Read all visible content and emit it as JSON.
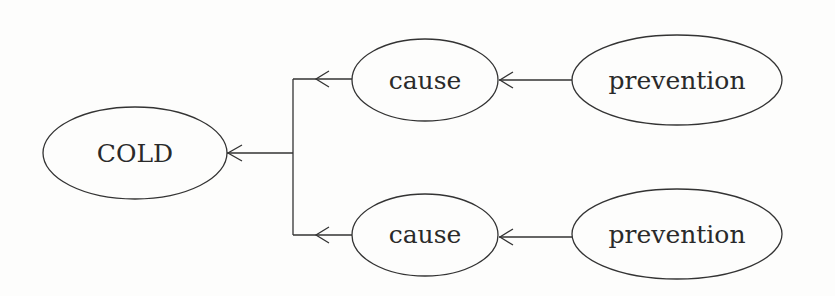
{
  "diagram": {
    "type": "cause-effect tree",
    "colors": {
      "stroke": "#333333",
      "text": "#2a2a2a",
      "background": "#fdfdfc"
    },
    "nodes": [
      {
        "id": "cold",
        "label": "COLD",
        "cx": 135,
        "cy": 153,
        "rx": 92,
        "ry": 46
      },
      {
        "id": "cause_top",
        "label": "cause",
        "cx": 425,
        "cy": 80,
        "rx": 73,
        "ry": 41
      },
      {
        "id": "cause_bottom",
        "label": "cause",
        "cx": 425,
        "cy": 235,
        "rx": 73,
        "ry": 41
      },
      {
        "id": "prevention_top",
        "label": "prevention",
        "cx": 677,
        "cy": 80,
        "rx": 105,
        "ry": 45
      },
      {
        "id": "prevention_bottom",
        "label": "prevention",
        "cx": 677,
        "cy": 234,
        "rx": 105,
        "ry": 45
      }
    ],
    "edges": [
      {
        "from": "cause_top",
        "to": "cold",
        "style": "elbow"
      },
      {
        "from": "cause_bottom",
        "to": "cold",
        "style": "elbow"
      },
      {
        "from": "prevention_top",
        "to": "cause_top",
        "style": "straight"
      },
      {
        "from": "prevention_bottom",
        "to": "cause_bottom",
        "style": "straight"
      }
    ]
  }
}
